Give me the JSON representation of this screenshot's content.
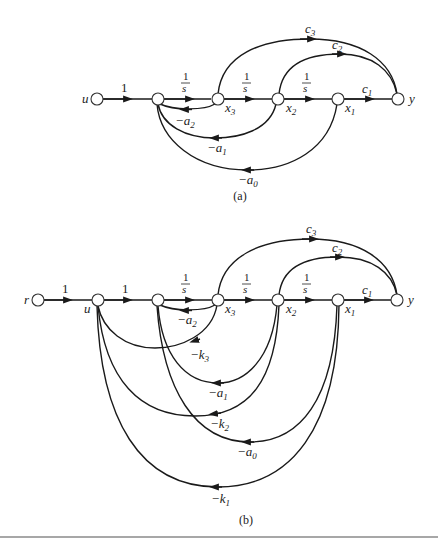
{
  "diagram_a": {
    "caption": "(a)",
    "nodes": [
      {
        "id": "u",
        "label": "u"
      },
      {
        "id": "sum",
        "label": ""
      },
      {
        "id": "x3",
        "label": "x",
        "sub": "3"
      },
      {
        "id": "x2",
        "label": "x",
        "sub": "2"
      },
      {
        "id": "x1",
        "label": "x",
        "sub": "1"
      },
      {
        "id": "y",
        "label": "y"
      }
    ],
    "forward_gains": {
      "u_sum": "1",
      "sum_x3": "1/s",
      "x3_x2": "1/s",
      "x2_x1": "1/s",
      "x1_y": "c1"
    },
    "feedforward": [
      {
        "from": "x3",
        "to": "y",
        "gain": "c",
        "sub": "3"
      },
      {
        "from": "x2",
        "to": "y",
        "gain": "c",
        "sub": "2"
      }
    ],
    "feedback": [
      {
        "from": "x3",
        "to": "sum",
        "gain": "−a",
        "sub": "2"
      },
      {
        "from": "x2",
        "to": "sum",
        "gain": "−a",
        "sub": "1"
      },
      {
        "from": "x1",
        "to": "sum",
        "gain": "−a",
        "sub": "0"
      }
    ],
    "labels": {
      "u": "u",
      "y": "y",
      "one": "1",
      "frac_num": "1",
      "frac_den": "s",
      "c1": "c",
      "c1_sub": "1",
      "c2": "c",
      "c2_sub": "2",
      "c3": "c",
      "c3_sub": "3",
      "x": "x",
      "x1_sub": "1",
      "x2_sub": "2",
      "x3_sub": "3",
      "neg_a": "−a",
      "a2_sub": "2",
      "a1_sub": "1",
      "a0_sub": "0"
    }
  },
  "diagram_b": {
    "caption": "(b)",
    "nodes": [
      {
        "id": "r",
        "label": "r"
      },
      {
        "id": "u",
        "label": "u"
      },
      {
        "id": "sum",
        "label": ""
      },
      {
        "id": "x3",
        "label": "x",
        "sub": "3"
      },
      {
        "id": "x2",
        "label": "x",
        "sub": "2"
      },
      {
        "id": "x1",
        "label": "x",
        "sub": "1"
      },
      {
        "id": "y",
        "label": "y"
      }
    ],
    "forward_gains": {
      "r_u": "1",
      "u_sum": "1",
      "sum_x3": "1/s",
      "x3_x2": "1/s",
      "x2_x1": "1/s",
      "x1_y": "c1"
    },
    "feedforward": [
      {
        "from": "x3",
        "to": "y",
        "gain": "c",
        "sub": "3"
      },
      {
        "from": "x2",
        "to": "y",
        "gain": "c",
        "sub": "2"
      }
    ],
    "feedback": [
      {
        "from": "x3",
        "to": "sum",
        "gain": "−a",
        "sub": "2"
      },
      {
        "from": "x3",
        "to": "u",
        "gain": "−k",
        "sub": "3"
      },
      {
        "from": "x2",
        "to": "sum",
        "gain": "−a",
        "sub": "1"
      },
      {
        "from": "x2",
        "to": "u",
        "gain": "−k",
        "sub": "2"
      },
      {
        "from": "x1",
        "to": "sum",
        "gain": "−a",
        "sub": "0"
      },
      {
        "from": "x1",
        "to": "u",
        "gain": "−k",
        "sub": "1"
      }
    ],
    "labels": {
      "r": "r",
      "u": "u",
      "y": "y",
      "one": "1",
      "frac_num": "1",
      "frac_den": "s",
      "c": "c",
      "c1_sub": "1",
      "c2_sub": "2",
      "c3_sub": "3",
      "x": "x",
      "x1_sub": "1",
      "x2_sub": "2",
      "x3_sub": "3",
      "neg_a": "−a",
      "a2_sub": "2",
      "a1_sub": "1",
      "a0_sub": "0",
      "neg_k": "−k",
      "k3_sub": "3",
      "k2_sub": "2",
      "k1_sub": "1"
    }
  },
  "colors": {
    "stroke": "#1a1a1a",
    "separator": "#8a8a8a",
    "background": "#ffffff"
  }
}
